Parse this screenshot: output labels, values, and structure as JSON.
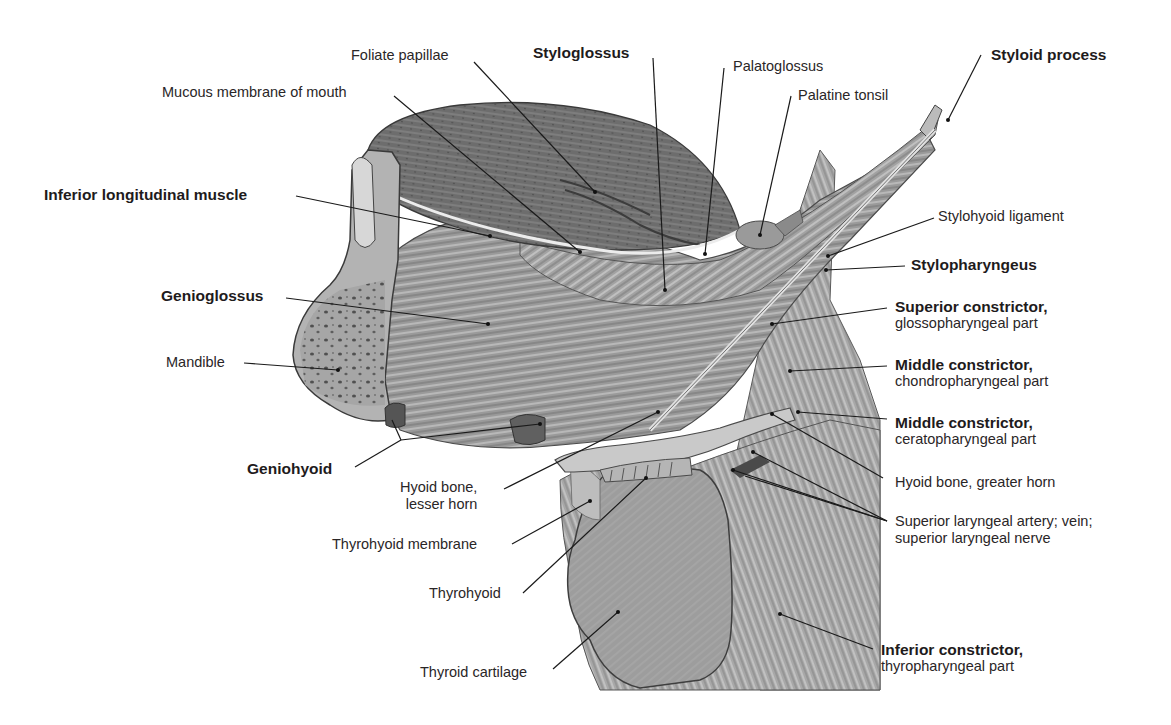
{
  "figure": {
    "colors": {
      "background": "#ffffff",
      "label_text": "#231f20",
      "leader_line": "#1a1a1a",
      "muscle_mid": "#8c8c8c",
      "muscle_light": "#c4c4c4",
      "muscle_dark": "#4e4e4e",
      "bone": "#a9a9a9"
    }
  },
  "labels": {
    "foliate_papillae": {
      "text": "Foliate papillae",
      "bold": false
    },
    "mucous_membrane": {
      "text": "Mucous membrane of mouth",
      "bold": false
    },
    "styloglossus": {
      "text": "Styloglossus",
      "bold": true
    },
    "palatoglossus": {
      "text": "Palatoglossus",
      "bold": false
    },
    "palatine_tonsil": {
      "text": "Palatine tonsil",
      "bold": false
    },
    "styloid_process": {
      "text": "Styloid process",
      "bold": true
    },
    "inferior_longitudinal": {
      "text": "Inferior longitudinal muscle",
      "bold": true
    },
    "stylohyoid_ligament": {
      "text": "Stylohyoid ligament",
      "bold": false
    },
    "stylopharyngeus": {
      "text": "Stylopharyngeus",
      "bold": true
    },
    "genioglossus": {
      "text": "Genioglossus",
      "bold": true
    },
    "superior_constrictor": {
      "text": "Superior constrictor,",
      "sub": "glossopharyngeal part",
      "bold": true
    },
    "mandible": {
      "text": "Mandible",
      "bold": false
    },
    "middle_constrictor_chondro": {
      "text": "Middle constrictor,",
      "sub": "chondropharyngeal part",
      "bold": true
    },
    "middle_constrictor_cerato": {
      "text": "Middle constrictor,",
      "sub": "ceratopharyngeal part",
      "bold": true
    },
    "geniohyoid": {
      "text": "Geniohyoid",
      "bold": true
    },
    "hyoid_greater_horn": {
      "text": "Hyoid bone, greater horn",
      "bold": false
    },
    "hyoid_lesser_horn": {
      "text": "Hyoid bone,",
      "sub": "lesser horn",
      "bold": false
    },
    "superior_laryngeal": {
      "text": "Superior laryngeal artery; vein;",
      "sub": "superior laryngeal nerve",
      "bold": false
    },
    "thyrohyoid_membrane": {
      "text": "Thyrohyoid membrane",
      "bold": false
    },
    "thyrohyoid": {
      "text": "Thyrohyoid",
      "bold": false
    },
    "thyroid_cartilage": {
      "text": "Thyroid cartilage",
      "bold": false
    },
    "inferior_constrictor": {
      "text": "Inferior constrictor,",
      "sub": "thyropharyngeal part",
      "bold": true
    }
  }
}
